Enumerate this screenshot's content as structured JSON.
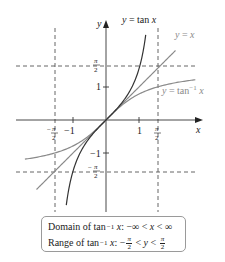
{
  "chart_data": {
    "type": "line",
    "title": "",
    "xlabel": "x",
    "ylabel": "y",
    "xlim": [
      -2.5,
      2.9
    ],
    "ylim": [
      -2.9,
      3.0
    ],
    "grid": false,
    "x_ticks": [
      {
        "value": -1.5708,
        "label": "-π/2"
      },
      {
        "value": -1,
        "label": "-1"
      },
      {
        "value": 1,
        "label": "1"
      },
      {
        "value": 1.5708,
        "label": "π/2"
      }
    ],
    "y_ticks": [
      {
        "value": 1.5708,
        "label": "π/2"
      },
      {
        "value": 1,
        "label": "1"
      },
      {
        "value": -1,
        "label": "-1"
      },
      {
        "value": -1.5708,
        "label": "-π/2"
      }
    ],
    "asymptotes": {
      "vertical": [
        -1.5708,
        1.5708
      ],
      "horizontal": [
        -1.5708,
        1.5708
      ],
      "style": "dashed"
    },
    "series": [
      {
        "name": "y = tan x",
        "function": "tan",
        "domain": [
          -1.2,
          1.2
        ],
        "color": "#333333"
      },
      {
        "name": "y = x",
        "function": "identity",
        "domain": [
          -2.1,
          2.1
        ],
        "color": "#8a8a8a"
      },
      {
        "name": "y = tan^-1 x",
        "function": "atan",
        "domain": [
          -2.45,
          2.7
        ],
        "color": "#8a8a8a"
      }
    ],
    "annotations": [
      {
        "text": "y = tan x",
        "x": 1.05,
        "y": 2.9
      },
      {
        "text": "y = x",
        "x": 2.05,
        "y": 2.35
      },
      {
        "text": "y = tan^-1 x",
        "x": 1.8,
        "y": 0.85
      }
    ]
  },
  "labels": {
    "x_axis": "x",
    "y_axis": "y",
    "tan": "y = tan x",
    "identity": "y = x",
    "atan_prefix": "y = tan",
    "atan_sup": "−1",
    "atan_var": "x",
    "x_tick_neg_half_pi_sign": "−",
    "x_tick_neg1": "−1",
    "x_tick_1": "1",
    "y_tick_1": "1",
    "y_tick_neg1": "−1",
    "pi": "π",
    "two": "2",
    "minus": "−"
  },
  "info_box": {
    "domain": {
      "prefix": "Domain of tan",
      "sup": "−1",
      "var": "x",
      "rest": ": −∞ < ",
      "var2": "x",
      "rest2": " < ∞"
    },
    "range": {
      "prefix": "Range of tan",
      "sup": "−1",
      "var": "x",
      "rest": ": −",
      "frac_num": "π",
      "frac_den": "2",
      "mid": " < ",
      "var2": "y",
      "mid2": " < ",
      "frac2_num": "π",
      "frac2_den": "2"
    }
  }
}
